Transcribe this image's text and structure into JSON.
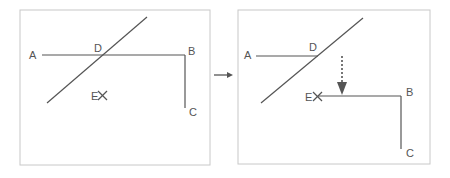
{
  "diagram": {
    "colors": {
      "line": "#555555",
      "frame": "#c8c8c8",
      "arrow": "#555555"
    },
    "left_panel": {
      "labels": {
        "A": "A",
        "B": "B",
        "C": "C",
        "D": "D",
        "E": "E"
      }
    },
    "right_panel": {
      "labels": {
        "A": "A",
        "B": "B",
        "C": "C",
        "D": "D",
        "E": "E"
      }
    },
    "transition_arrow": "→"
  }
}
